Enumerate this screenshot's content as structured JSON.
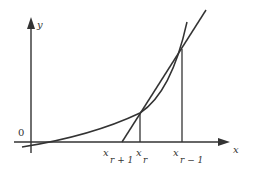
{
  "figure": {
    "axes": {
      "x_label": "x",
      "y_label": "y",
      "origin_label": "0"
    },
    "ticks": [
      {
        "id": "x_r_plus_1",
        "base": "x",
        "sub": "r + 1"
      },
      {
        "id": "x_r",
        "base": "x",
        "sub": "r"
      },
      {
        "id": "x_r_minus_1",
        "base": "x",
        "sub": "r − 1"
      }
    ],
    "colors": {
      "stroke": "#333333",
      "background": "#ffffff"
    }
  }
}
